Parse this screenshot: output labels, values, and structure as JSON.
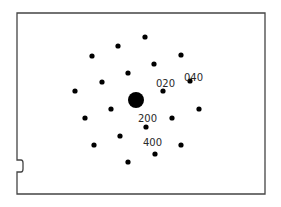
{
  "diagram": {
    "type": "electron diffraction pattern",
    "frame": {
      "x": 17,
      "y": 13,
      "width": 248,
      "height": 181,
      "stroke": "#444444"
    },
    "central_spot": {
      "cx": 136,
      "cy": 100,
      "r": 8,
      "color": "#000000"
    },
    "spot_radius": 2.6,
    "spots": [
      {
        "cx": 145,
        "cy": 37
      },
      {
        "cx": 118,
        "cy": 46
      },
      {
        "cx": 92,
        "cy": 56
      },
      {
        "cx": 181,
        "cy": 55
      },
      {
        "cx": 154,
        "cy": 64
      },
      {
        "cx": 128,
        "cy": 73
      },
      {
        "cx": 102,
        "cy": 82
      },
      {
        "cx": 190,
        "cy": 81
      },
      {
        "cx": 163,
        "cy": 91
      },
      {
        "cx": 75,
        "cy": 91
      },
      {
        "cx": 111,
        "cy": 109
      },
      {
        "cx": 199,
        "cy": 109
      },
      {
        "cx": 85,
        "cy": 118
      },
      {
        "cx": 172,
        "cy": 118
      },
      {
        "cx": 146,
        "cy": 127
      },
      {
        "cx": 120,
        "cy": 136
      },
      {
        "cx": 94,
        "cy": 145
      },
      {
        "cx": 181,
        "cy": 145
      },
      {
        "cx": 155,
        "cy": 154
      },
      {
        "cx": 128,
        "cy": 162
      }
    ],
    "labels": [
      {
        "text": "020",
        "x": 156,
        "y": 87
      },
      {
        "text": "040",
        "x": 184,
        "y": 81
      },
      {
        "text": "200",
        "x": 138,
        "y": 122
      },
      {
        "text": "400",
        "x": 143,
        "y": 146
      }
    ]
  }
}
